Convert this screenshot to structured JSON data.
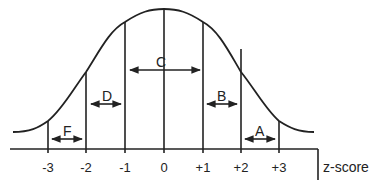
{
  "diagram": {
    "type": "normal-distribution",
    "colors": {
      "stroke": "#222222",
      "background": "#ffffff"
    },
    "axis": {
      "title": "z-score",
      "ticks": [
        {
          "value": -3,
          "label": "-3"
        },
        {
          "value": -2,
          "label": "-2"
        },
        {
          "value": -1,
          "label": "-1"
        },
        {
          "value": 0,
          "label": "0"
        },
        {
          "value": 1,
          "label": "+1"
        },
        {
          "value": 2,
          "label": "+2"
        },
        {
          "value": 3,
          "label": "+3"
        }
      ]
    },
    "regions": [
      {
        "label": "F",
        "from": "-3",
        "to": "-2"
      },
      {
        "label": "D",
        "from": "-2",
        "to": "-1"
      },
      {
        "label": "C",
        "from": "-1",
        "to": "+1"
      },
      {
        "label": "B",
        "from": "+1",
        "to": "+2"
      },
      {
        "label": "A",
        "from": "+2",
        "to": "+3"
      }
    ]
  }
}
